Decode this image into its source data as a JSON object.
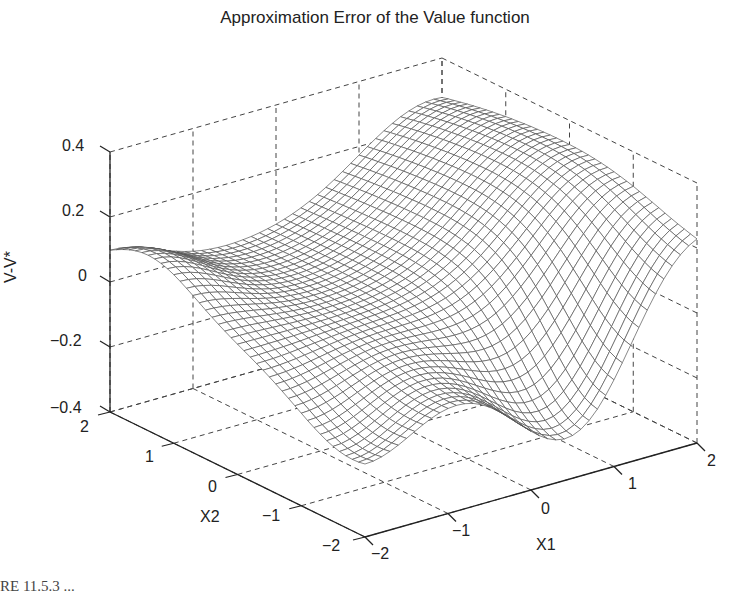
{
  "chart_data": {
    "type": "surface",
    "title": "Approximation Error of the Value function",
    "xlabel": "X1",
    "ylabel": "X2",
    "zlabel": "V-V*",
    "xlim": [
      -2,
      2
    ],
    "ylim": [
      -2,
      2
    ],
    "zlim": [
      -0.4,
      0.4
    ],
    "x_ticks": [
      "-2",
      "-1",
      "0",
      "1",
      "2"
    ],
    "y_ticks": [
      "-2",
      "-1",
      "0",
      "1",
      "2"
    ],
    "z_ticks": [
      "-0.4",
      "-0.2",
      "0",
      "0.2",
      "0.4"
    ],
    "grid": true,
    "style": "mesh",
    "mesh_resolution": 41,
    "sample_points": [
      {
        "x1": 2,
        "x2": 0,
        "z": 0.3
      },
      {
        "x1": 1.5,
        "x2": 1.5,
        "z": 0.35
      },
      {
        "x1": 0.5,
        "x2": -2,
        "z": -0.35
      },
      {
        "x1": -2,
        "x2": 2,
        "z": 0.1
      },
      {
        "x1": -2,
        "x2": -2,
        "z": -0.15
      },
      {
        "x1": 0,
        "x2": 0,
        "z": 0.0
      }
    ]
  },
  "caption": {
    "text": "RE 11.5.3  ..."
  }
}
